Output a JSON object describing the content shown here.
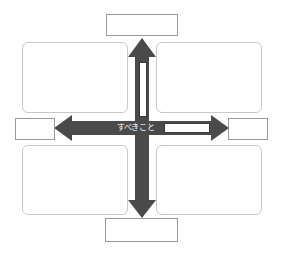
{
  "diagram": {
    "type": "quadrant-cross-arrow",
    "center_label": "すべきこと",
    "axis_labels": {
      "top": "",
      "bottom": "",
      "left": "",
      "right": ""
    },
    "quadrants": [
      {
        "position": "top-left",
        "text": ""
      },
      {
        "position": "top-right",
        "text": ""
      },
      {
        "position": "bottom-left",
        "text": ""
      },
      {
        "position": "bottom-right",
        "text": ""
      }
    ],
    "inner_fields": {
      "vertical_arrow_field": "",
      "horizontal_arrow_field": ""
    },
    "colors": {
      "arrow": "#4a4a4a",
      "quadrant_border": "#c8c8c8",
      "label_border": "#9a9a9a",
      "background": "#ffffff"
    }
  }
}
